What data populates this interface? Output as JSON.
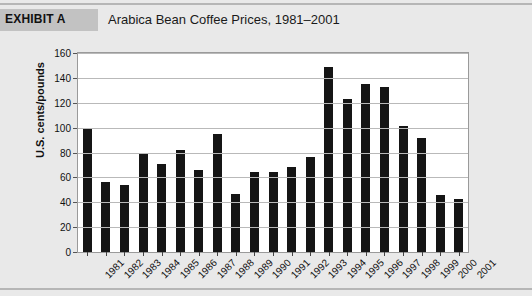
{
  "header": {
    "exhibit_tag": "EXHIBIT A",
    "title": "Arabica Bean Coffee Prices, 1981–2001"
  },
  "colors": {
    "page_background": "#e9e9e9",
    "exhibit_band": "#c2c2c2",
    "plot_background": "#ffffff",
    "bar_fill": "#151515",
    "gridline": "#b9b9b9",
    "axis_border": "#9a9a9a",
    "text": "#111111"
  },
  "chart_data": {
    "type": "bar",
    "title": "Arabica Bean Coffee Prices, 1981–2001",
    "xlabel": "",
    "ylabel": "U.S. cents/pounds",
    "categories": [
      "1981",
      "1982",
      "1983",
      "1984",
      "1985",
      "1986",
      "1987",
      "1988",
      "1989",
      "1990",
      "1991",
      "1992",
      "1993",
      "1994",
      "1995",
      "1996",
      "1997",
      "1998",
      "1999",
      "2000",
      "2001"
    ],
    "values": [
      99,
      56,
      54,
      79,
      71,
      82,
      66,
      95,
      47,
      64,
      64,
      68,
      76,
      149,
      123,
      135,
      133,
      101,
      92,
      46,
      43
    ],
    "ylim": [
      0,
      160
    ],
    "yticks": [
      0,
      20,
      40,
      60,
      80,
      100,
      120,
      140,
      160
    ],
    "ytick_labels": [
      "0",
      "20",
      "40",
      "60",
      "80",
      "100",
      "120",
      "140",
      "160"
    ],
    "grid": true,
    "legend": false,
    "legend_position": "none"
  }
}
